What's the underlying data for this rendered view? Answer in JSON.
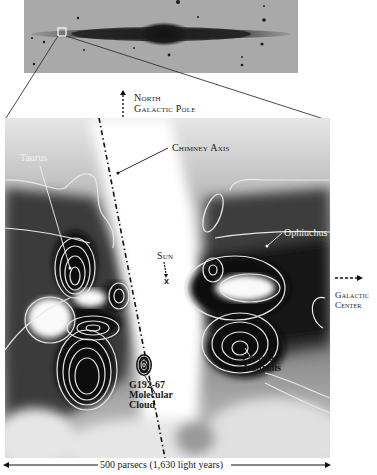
{
  "inset": {
    "description": "edge-on galaxy photograph",
    "colors": {
      "background": "#a9a9a9",
      "disk": "#1c1c1c",
      "zoom_box": "#ffffff"
    }
  },
  "labels": {
    "north_pole_line1": "North",
    "north_pole_line2": "Galactic Pole",
    "chimney_axis": "Chimney Axis",
    "taurus": "Taurus",
    "sun": "Sun",
    "sun_marker": "x",
    "ophiuchus": "Ophiuchus",
    "galactic_center_line1": "Galactic",
    "galactic_center_line2": "Center",
    "corona_line1": "Corona",
    "corona_line2": "Australis",
    "cloud_line1": "G192-67",
    "cloud_line2": "Molecular",
    "cloud_line3": "Cloud"
  },
  "scale_bar": {
    "label": "500 parsecs (1,630 light years)"
  },
  "colors": {
    "dense_region": "#111111",
    "contour": "#e8e8e8",
    "void": "#ffffff",
    "mid_gray": "#7a7a7a",
    "text": "#1a1a1a"
  }
}
